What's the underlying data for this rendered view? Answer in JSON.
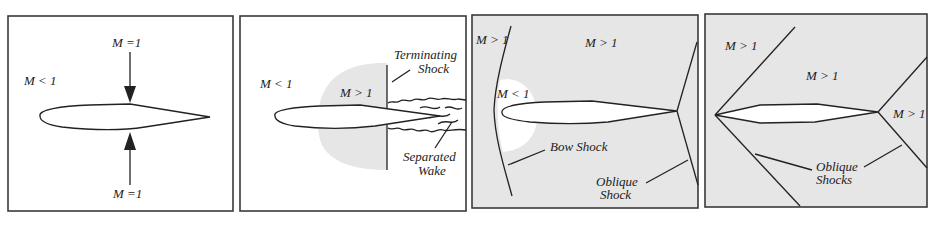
{
  "figure": {
    "colors": {
      "background": "#ffffff",
      "supersonic_fill": "#e6e6e6",
      "line": "#222222",
      "frame": "#3a3a3a"
    },
    "panels": [
      {
        "id": "panel-1",
        "labels": {
          "free_stream": "M < 1",
          "top": "M =1",
          "bottom": "M =1"
        }
      },
      {
        "id": "panel-2",
        "labels": {
          "free_stream": "M < 1",
          "pocket": "M > 1",
          "shock_1": "Terminating",
          "shock_2": "Shock",
          "wake_1": "Separated",
          "wake_2": "Wake"
        }
      },
      {
        "id": "panel-3",
        "labels": {
          "upstream": "M > 1",
          "main": "M > 1",
          "subsonic": "M < 1",
          "bow": "Bow Shock",
          "oblique_1": "Oblique",
          "oblique_2": "Shock"
        }
      },
      {
        "id": "panel-4",
        "labels": {
          "upper_left": "M > 1",
          "main": "M > 1",
          "trailing": "M > 1",
          "oblique_1": "Oblique",
          "oblique_2": "Shocks"
        }
      }
    ]
  }
}
